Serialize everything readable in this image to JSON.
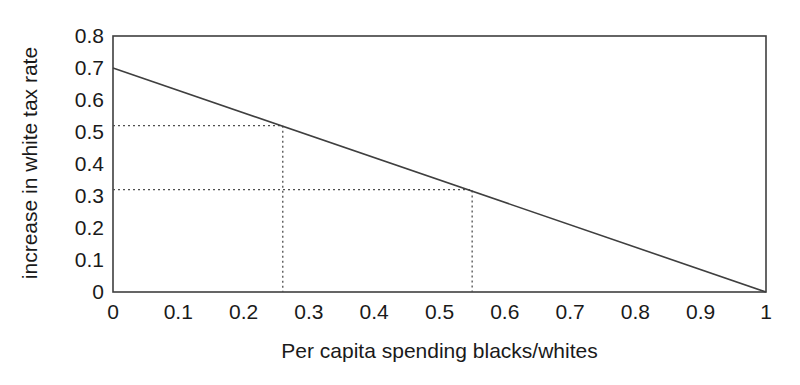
{
  "chart_data": {
    "type": "line",
    "title": "",
    "xlabel": "Per capita spending blacks/whites",
    "ylabel": "increase in white tax rate",
    "xlim": [
      0,
      1
    ],
    "ylim": [
      0,
      0.8
    ],
    "x_ticks": [
      0,
      0.1,
      0.2,
      0.3,
      0.4,
      0.5,
      0.6,
      0.7,
      0.8,
      0.9,
      1
    ],
    "x_tick_labels": [
      "0",
      "0.1",
      "0.2",
      "0.3",
      "0.4",
      "0.5",
      "0.6",
      "0.7",
      "0.8",
      "0.9",
      "1"
    ],
    "y_ticks": [
      0,
      0.1,
      0.2,
      0.3,
      0.4,
      0.5,
      0.6,
      0.7,
      0.8
    ],
    "y_tick_labels": [
      "0",
      "0.1",
      "0.2",
      "0.3",
      "0.4",
      "0.5",
      "0.6",
      "0.7",
      "0.8"
    ],
    "series": [
      {
        "name": "white-tax-rate-line",
        "x": [
          0,
          1
        ],
        "y": [
          0.7,
          0
        ],
        "style": "solid"
      }
    ],
    "guides": [
      {
        "x": 0.26,
        "y": 0.52,
        "style": "dotted"
      },
      {
        "x": 0.55,
        "y": 0.32,
        "style": "dotted"
      }
    ],
    "grid": false,
    "legend": false,
    "frame": "box",
    "colors": {
      "line": "#3f3f3f",
      "frame": "#3f3f3f",
      "guide": "#4f4f4f",
      "text": "#1a1a1a",
      "background": "#ffffff"
    }
  }
}
